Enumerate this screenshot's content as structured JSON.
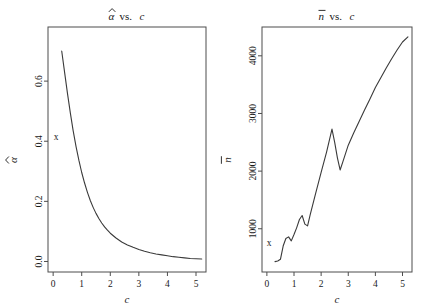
{
  "figure": {
    "width": 424,
    "height": 308,
    "background": "#ffffff",
    "line_color": "#3a3a3a",
    "axis_color": "#4d4d4d",
    "text_color": "#1a1a1a"
  },
  "chart_data": [
    {
      "type": "line",
      "title": "α̂ vs. c",
      "title_parts": {
        "symbol": "α",
        "accent": "hat",
        "connector": "vs.",
        "variable": "c"
      },
      "xlabel": "c",
      "ylabel": "α̂",
      "ylabel_parts": {
        "symbol": "α",
        "accent": "hat"
      },
      "xlim": [
        -0.18,
        5.35
      ],
      "ylim": [
        -0.035,
        0.78
      ],
      "xticks": [
        0,
        1,
        2,
        3,
        4,
        5
      ],
      "xticklabels": [
        "0",
        "1",
        "2",
        "3",
        "4",
        "5"
      ],
      "yticks": [
        0.0,
        0.2,
        0.4,
        0.6
      ],
      "yticklabels": [
        "0.0",
        "0.2",
        "0.4",
        "0.6"
      ],
      "grid": false,
      "legend": null,
      "annotations": [
        {
          "text": "x",
          "x": 0.1,
          "y": 0.405,
          "name": "x-marker"
        }
      ],
      "x": [
        0.3,
        0.4,
        0.5,
        0.6,
        0.7,
        0.8,
        0.9,
        1.0,
        1.1,
        1.2,
        1.3,
        1.4,
        1.5,
        1.6,
        1.7,
        1.8,
        1.9,
        2.0,
        2.2,
        2.4,
        2.6,
        2.8,
        3.0,
        3.2,
        3.4,
        3.6,
        3.8,
        4.0,
        4.2,
        4.4,
        4.6,
        4.8,
        5.0,
        5.2
      ],
      "y": [
        0.7,
        0.63,
        0.56,
        0.495,
        0.435,
        0.383,
        0.337,
        0.296,
        0.261,
        0.23,
        0.203,
        0.18,
        0.16,
        0.143,
        0.128,
        0.115,
        0.104,
        0.094,
        0.078,
        0.065,
        0.055,
        0.047,
        0.04,
        0.034,
        0.029,
        0.025,
        0.022,
        0.019,
        0.016,
        0.014,
        0.012,
        0.01,
        0.009,
        0.008
      ]
    },
    {
      "type": "line",
      "title": "n̄ vs. c",
      "title_parts": {
        "symbol": "n",
        "accent": "bar",
        "connector": "vs.",
        "variable": "c"
      },
      "xlabel": "c",
      "ylabel": "n̄",
      "ylabel_parts": {
        "symbol": "n",
        "accent": "bar"
      },
      "xlim": [
        -0.18,
        5.35
      ],
      "ylim": [
        250,
        4500
      ],
      "xticks": [
        0,
        1,
        2,
        3,
        4,
        5
      ],
      "xticklabels": [
        "0",
        "1",
        "2",
        "3",
        "4",
        "5"
      ],
      "yticks": [
        1000,
        2000,
        3000,
        4000
      ],
      "yticklabels": [
        "1000",
        "2000",
        "3000",
        "4000"
      ],
      "grid": false,
      "legend": null,
      "annotations": [
        {
          "text": "x",
          "x": 0.08,
          "y": 700,
          "name": "x-marker"
        }
      ],
      "x": [
        0.3,
        0.4,
        0.5,
        0.6,
        0.7,
        0.8,
        0.9,
        1.0,
        1.1,
        1.2,
        1.3,
        1.4,
        1.5,
        1.6,
        1.8,
        2.0,
        2.2,
        2.4,
        2.5,
        2.6,
        2.7,
        2.8,
        3.0,
        3.2,
        3.4,
        3.6,
        3.8,
        4.0,
        4.2,
        4.4,
        4.6,
        4.8,
        5.0,
        5.2
      ],
      "y": [
        430,
        440,
        470,
        700,
        830,
        860,
        790,
        900,
        1020,
        1160,
        1230,
        1080,
        1050,
        1250,
        1620,
        1980,
        2330,
        2730,
        2500,
        2230,
        2020,
        2160,
        2450,
        2660,
        2860,
        3060,
        3250,
        3450,
        3620,
        3790,
        3950,
        4100,
        4240,
        4330
      ]
    }
  ]
}
